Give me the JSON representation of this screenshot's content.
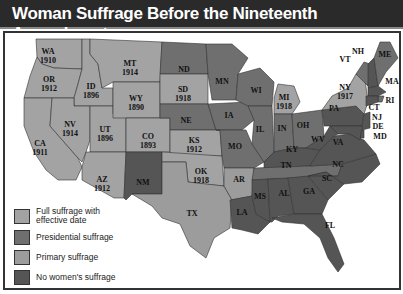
{
  "title": "Woman Suffrage Before the Nineteenth Amendment",
  "colors": {
    "full": "#a3a3a3",
    "presidential": "#6f6f6f",
    "primary": "#9c9c9c",
    "none": "#555555",
    "water": "#ffffff",
    "canada": "#ffffff"
  },
  "legend": [
    {
      "key": "full",
      "label": "Full suffrage with effective date"
    },
    {
      "key": "presidential",
      "label": "Presidential suffrage"
    },
    {
      "key": "primary",
      "label": "Primary suffrage"
    },
    {
      "key": "none",
      "label": "No women's suffrage"
    }
  ],
  "states": {
    "WA": {
      "abbr": "WA",
      "year": "1910",
      "category": "full"
    },
    "OR": {
      "abbr": "OR",
      "year": "1912",
      "category": "full"
    },
    "CA": {
      "abbr": "CA",
      "year": "1911",
      "category": "full"
    },
    "ID": {
      "abbr": "ID",
      "year": "1896",
      "category": "full"
    },
    "NV": {
      "abbr": "NV",
      "year": "1914",
      "category": "full"
    },
    "UT": {
      "abbr": "UT",
      "year": "1896",
      "category": "full"
    },
    "AZ": {
      "abbr": "AZ",
      "year": "1912",
      "category": "full"
    },
    "MT": {
      "abbr": "MT",
      "year": "1914",
      "category": "full"
    },
    "WY": {
      "abbr": "WY",
      "year": "1890",
      "category": "full"
    },
    "CO": {
      "abbr": "CO",
      "year": "1893",
      "category": "full"
    },
    "NM": {
      "abbr": "NM",
      "year": "",
      "category": "none"
    },
    "ND": {
      "abbr": "ND",
      "year": "",
      "category": "presidential"
    },
    "SD": {
      "abbr": "SD",
      "year": "1918",
      "category": "full"
    },
    "NE": {
      "abbr": "NE",
      "year": "",
      "category": "presidential"
    },
    "KS": {
      "abbr": "KS",
      "year": "1912",
      "category": "full"
    },
    "OK": {
      "abbr": "OK",
      "year": "1918",
      "category": "full"
    },
    "TX": {
      "abbr": "TX",
      "year": "",
      "category": "primary"
    },
    "MN": {
      "abbr": "MN",
      "year": "",
      "category": "presidential"
    },
    "IA": {
      "abbr": "IA",
      "year": "",
      "category": "presidential"
    },
    "MO": {
      "abbr": "MO",
      "year": "",
      "category": "presidential"
    },
    "AR": {
      "abbr": "AR",
      "year": "",
      "category": "primary"
    },
    "LA": {
      "abbr": "LA",
      "year": "",
      "category": "none"
    },
    "WI": {
      "abbr": "WI",
      "year": "",
      "category": "presidential"
    },
    "IL": {
      "abbr": "IL",
      "year": "",
      "category": "presidential"
    },
    "MI": {
      "abbr": "MI",
      "year": "1918",
      "category": "full"
    },
    "IN": {
      "abbr": "IN",
      "year": "",
      "category": "presidential"
    },
    "OH": {
      "abbr": "OH",
      "year": "",
      "category": "presidential"
    },
    "KY": {
      "abbr": "KY",
      "year": "",
      "category": "none"
    },
    "TN": {
      "abbr": "TN",
      "year": "",
      "category": "presidential"
    },
    "MS": {
      "abbr": "MS",
      "year": "",
      "category": "none"
    },
    "AL": {
      "abbr": "AL",
      "year": "",
      "category": "none"
    },
    "GA": {
      "abbr": "GA",
      "year": "",
      "category": "none"
    },
    "FL": {
      "abbr": "FL",
      "year": "",
      "category": "none"
    },
    "SC": {
      "abbr": "SC",
      "year": "",
      "category": "none"
    },
    "NC": {
      "abbr": "NC",
      "year": "",
      "category": "none"
    },
    "VA": {
      "abbr": "VA",
      "year": "",
      "category": "none"
    },
    "WV": {
      "abbr": "WV",
      "year": "",
      "category": "none"
    },
    "PA": {
      "abbr": "PA",
      "year": "",
      "category": "none"
    },
    "NY": {
      "abbr": "NY",
      "year": "1917",
      "category": "full"
    },
    "VT": {
      "abbr": "VT",
      "year": "",
      "category": "presidential"
    },
    "NH": {
      "abbr": "NH",
      "year": "",
      "category": "none"
    },
    "ME": {
      "abbr": "ME",
      "year": "",
      "category": "presidential"
    },
    "MA": {
      "abbr": "MA",
      "year": "",
      "category": "none"
    },
    "RI": {
      "abbr": "RI",
      "year": "",
      "category": "presidential"
    },
    "CT": {
      "abbr": "CT",
      "year": "",
      "category": "none"
    },
    "NJ": {
      "abbr": "NJ",
      "year": "",
      "category": "none"
    },
    "DE": {
      "abbr": "DE",
      "year": "",
      "category": "none"
    },
    "MD": {
      "abbr": "MD",
      "year": "",
      "category": "none"
    }
  }
}
